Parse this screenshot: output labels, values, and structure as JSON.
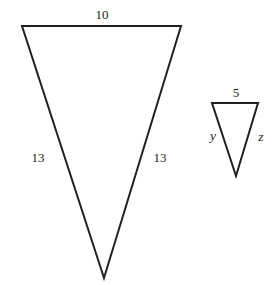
{
  "figure": {
    "background_color": "#ffffff",
    "stroke_color": "#231f20",
    "text_color": "#231f20",
    "width": 276,
    "height": 285
  },
  "large_triangle": {
    "name": "large-triangle",
    "orientation": "inverted",
    "vertices": {
      "top_left": {
        "x": 22,
        "y": 26
      },
      "top_right": {
        "x": 181,
        "y": 26
      },
      "bottom": {
        "x": 104,
        "y": 278
      }
    },
    "labels": {
      "top": {
        "text": "10",
        "x": 102,
        "y": 14
      },
      "left": {
        "text": "13",
        "x": 38,
        "y": 157
      },
      "right": {
        "text": "13",
        "x": 160,
        "y": 157
      }
    }
  },
  "small_triangle": {
    "name": "small-triangle",
    "orientation": "inverted",
    "vertices": {
      "top_left": {
        "x": 212,
        "y": 103
      },
      "top_right": {
        "x": 258,
        "y": 103
      },
      "bottom": {
        "x": 236,
        "y": 176
      }
    },
    "labels": {
      "top": {
        "text": "5",
        "x": 236,
        "y": 92
      },
      "left": {
        "text": "y",
        "x": 213,
        "y": 136
      },
      "right": {
        "text": "z",
        "x": 261,
        "y": 137
      }
    }
  }
}
